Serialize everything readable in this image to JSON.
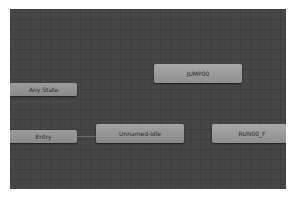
{
  "window": {
    "panel": "Animator state machine graph"
  },
  "graph": {
    "background_color": "#464646",
    "nodes": [
      {
        "id": "any-state",
        "label": "Any State",
        "type": "special"
      },
      {
        "id": "entry",
        "label": "Entry",
        "type": "special"
      },
      {
        "id": "unnamed-idle",
        "label": "Unnamed-idle",
        "type": "default-state"
      },
      {
        "id": "jump00",
        "label": "JUMP00",
        "type": "state"
      },
      {
        "id": "run00-f",
        "label": "RUN00_F",
        "type": "state"
      }
    ],
    "transitions": [
      {
        "from": "Entry",
        "to": "Unnamed-idle"
      }
    ]
  }
}
